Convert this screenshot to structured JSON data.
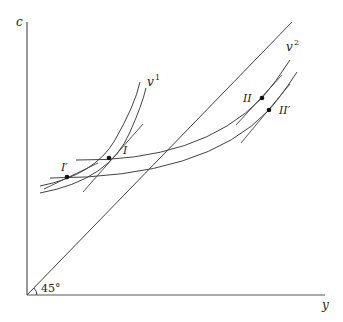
{
  "diagram": {
    "axes": {
      "y_axis_label": "c",
      "x_axis_label": "y",
      "angle_label": "45°"
    },
    "curves": {
      "v1_label": "v",
      "v1_sup": "1",
      "v2_label": "v",
      "v2_sup": "2"
    },
    "points": {
      "I": "I",
      "I_prime": "I′",
      "II": "II",
      "II_prime": "II′"
    },
    "colors": {
      "line": "#444444",
      "background": "#ffffff"
    }
  }
}
